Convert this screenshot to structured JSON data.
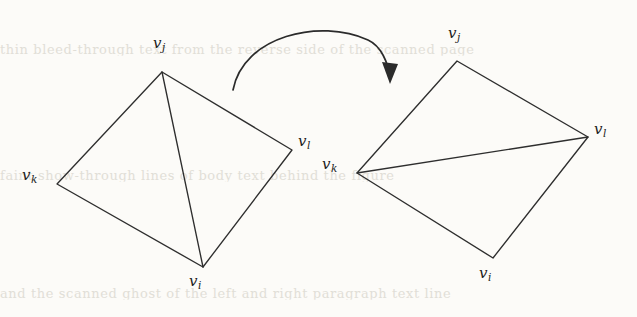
{
  "figure": {
    "name": "edge-flip-diagram",
    "caption": "",
    "background_color": "#fcfbf8",
    "ink_color": "#2e2e2e"
  },
  "ghost_text": {
    "top": "thin bleed-through text from the reverse side of the scanned page",
    "middle": "faint show-through lines of body text behind the figure",
    "bottom": "and the scanned ghost of the left and right paragraph text line"
  },
  "left_polygon": {
    "name": "quadrilateral-before-flip",
    "vertices": [
      {
        "id": "vj",
        "base": "v",
        "sub": "j",
        "x": 162,
        "y": 72,
        "label_x": 153,
        "label_y": 36
      },
      {
        "id": "vl",
        "base": "v",
        "sub": "l",
        "x": 292,
        "y": 150,
        "label_x": 298,
        "label_y": 134
      },
      {
        "id": "vi",
        "base": "v",
        "sub": "i",
        "x": 203,
        "y": 267,
        "label_x": 189,
        "label_y": 274
      },
      {
        "id": "vk",
        "base": "v",
        "sub": "k",
        "x": 57,
        "y": 184,
        "label_x": 22,
        "label_y": 168
      }
    ],
    "diagonal": {
      "from": "vj",
      "to": "vi"
    }
  },
  "right_polygon": {
    "name": "quadrilateral-after-flip",
    "vertices": [
      {
        "id": "vj",
        "base": "v",
        "sub": "j",
        "x": 457,
        "y": 61,
        "label_x": 448,
        "label_y": 26
      },
      {
        "id": "vl",
        "base": "v",
        "sub": "l",
        "x": 588,
        "y": 137,
        "label_x": 594,
        "label_y": 122
      },
      {
        "id": "vi",
        "base": "v",
        "sub": "i",
        "x": 493,
        "y": 258,
        "label_x": 479,
        "label_y": 266
      },
      {
        "id": "vk",
        "base": "v",
        "sub": "k",
        "x": 357,
        "y": 173,
        "label_x": 322,
        "label_y": 157
      }
    ],
    "diagonal": {
      "from": "vk",
      "to": "vl"
    }
  },
  "arrow": {
    "name": "flip-transition-arrow",
    "path": "M 233 90 C 243 36, 320 18, 368 40 C 381 46, 388 62, 390 78",
    "head_points": "390,84 382,62 398,64",
    "direction": "left-to-right"
  }
}
